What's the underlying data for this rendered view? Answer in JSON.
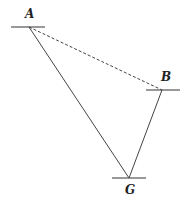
{
  "diagram": {
    "points": {
      "A": {
        "label": "A",
        "x": 29,
        "y": 27
      },
      "B": {
        "label": "B",
        "x": 162,
        "y": 90
      },
      "G": {
        "label": "G",
        "x": 129,
        "y": 178
      }
    },
    "edges": [
      {
        "from": "A",
        "to": "B",
        "style": "dashed"
      },
      {
        "from": "A",
        "to": "G",
        "style": "solid"
      },
      {
        "from": "B",
        "to": "G",
        "style": "solid"
      }
    ],
    "colors": {
      "line": "#444444",
      "label": "#222222"
    }
  }
}
